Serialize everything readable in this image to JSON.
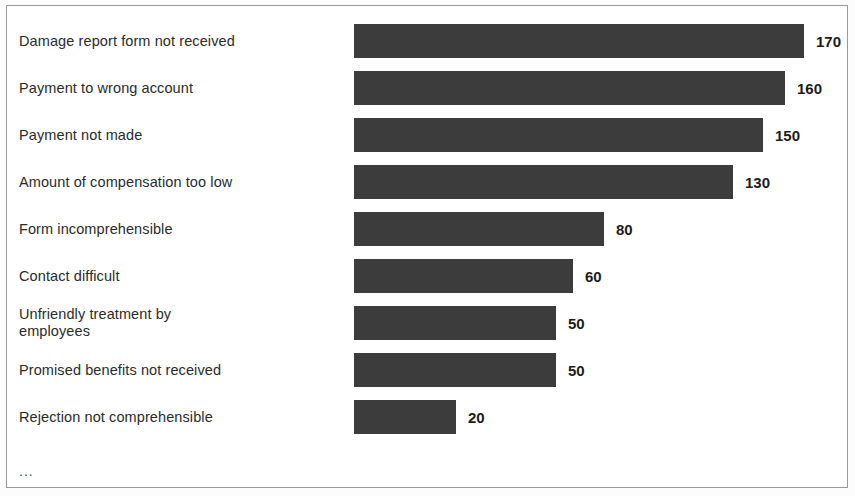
{
  "chart_data": {
    "type": "bar",
    "orientation": "horizontal",
    "title": "",
    "subtitle": "",
    "xlabel": "",
    "ylabel": "",
    "grid": false,
    "legend": null,
    "axis_visible": false,
    "value_labels_shown": true,
    "bar_color": "#3c3c3c",
    "frame_color": "#9a9a9a",
    "background_color": "#ffffff",
    "categories": [
      "Damage report form not received",
      "Payment to wrong account",
      "Payment not made",
      "Amount of compensation too low",
      "Form incomprehensible",
      "Contact difficult",
      "Unfriendly treatment by\nemployees",
      "Promised benefits not received",
      "Rejection not comprehensible"
    ],
    "values": [
      170,
      160,
      150,
      130,
      80,
      60,
      50,
      50,
      20
    ],
    "value_text": [
      "170",
      "160",
      "150",
      "130",
      "80",
      "60",
      "50",
      "50",
      "20"
    ],
    "bar_pixel_widths": [
      450,
      431,
      409,
      379,
      250,
      219,
      202,
      202,
      102
    ],
    "trailing_note": "...",
    "xlim": [
      0,
      170
    ],
    "ylim": null
  }
}
